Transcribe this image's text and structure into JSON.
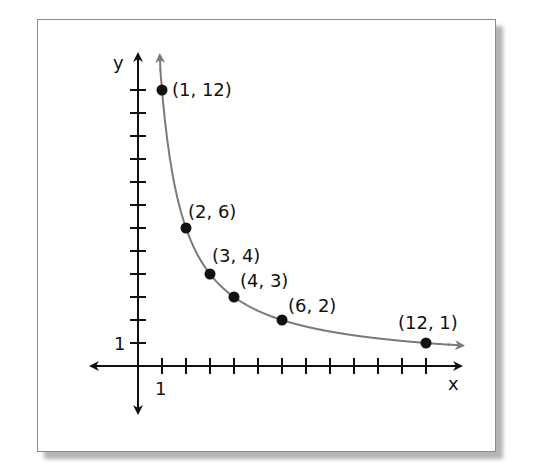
{
  "chart_data": {
    "type": "line",
    "title": "",
    "xlabel": "x",
    "ylabel": "y",
    "xlim": [
      0,
      12
    ],
    "ylim": [
      0,
      12
    ],
    "x_ticks": [
      1,
      2,
      3,
      4,
      5,
      6,
      7,
      8,
      9,
      10,
      11,
      12
    ],
    "y_ticks": [
      1,
      2,
      3,
      4,
      5,
      6,
      7,
      8,
      9,
      10,
      11,
      12
    ],
    "x_tick_labels_shown": {
      "1": "1"
    },
    "y_tick_labels_shown": {
      "1": "1"
    },
    "grid": false,
    "series": [
      {
        "name": "y = 12/x",
        "color": "#777777",
        "points": [
          {
            "x": 1,
            "y": 12,
            "label": "(1, 12)"
          },
          {
            "x": 2,
            "y": 6,
            "label": "(2, 6)"
          },
          {
            "x": 3,
            "y": 4,
            "label": "(3, 4)"
          },
          {
            "x": 4,
            "y": 3,
            "label": "(4, 3)"
          },
          {
            "x": 6,
            "y": 2,
            "label": "(6, 2)"
          },
          {
            "x": 12,
            "y": 1,
            "label": "(12, 1)"
          }
        ]
      }
    ]
  },
  "axes": {
    "x_label": "x",
    "y_label": "y",
    "x_one": "1",
    "y_one": "1",
    "axis_color": "#111111",
    "curve_color": "#777777"
  }
}
